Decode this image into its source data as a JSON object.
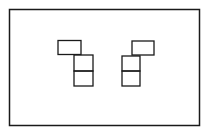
{
  "diagram": {
    "stroke_color": "#1a1a1a",
    "background_color": "#ffffff",
    "figures": [
      {
        "name": "left-figure",
        "orientation": "top-block-offset-left",
        "blocks": 3
      },
      {
        "name": "right-figure",
        "orientation": "top-block-offset-right",
        "blocks": 3
      }
    ]
  }
}
